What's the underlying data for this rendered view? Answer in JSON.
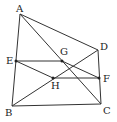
{
  "diagram": {
    "type": "geometry",
    "points": {
      "A": {
        "x": 20,
        "y": 14,
        "label_dx": -4,
        "label_dy": -2
      },
      "B": {
        "x": 12,
        "y": 106,
        "label_dx": -7,
        "label_dy": 10
      },
      "C": {
        "x": 101,
        "y": 104,
        "label_dx": 2,
        "label_dy": 10
      },
      "D": {
        "x": 98,
        "y": 50,
        "label_dx": 2,
        "label_dy": 0
      },
      "E": {
        "x": 16,
        "y": 61,
        "label_dx": -10,
        "label_dy": 3
      },
      "F": {
        "x": 99,
        "y": 78,
        "label_dx": 4,
        "label_dy": 4
      },
      "G": {
        "x": 62,
        "y": 61,
        "label_dx": -2,
        "label_dy": -6
      },
      "H": {
        "x": 53,
        "y": 78,
        "label_dx": -2,
        "label_dy": 11
      }
    },
    "labels": [
      "A",
      "B",
      "C",
      "D",
      "E",
      "F",
      "G",
      "H"
    ],
    "segments": [
      [
        "A",
        "B"
      ],
      [
        "A",
        "D"
      ],
      [
        "A",
        "C"
      ],
      [
        "B",
        "C"
      ],
      [
        "D",
        "C"
      ],
      [
        "B",
        "D"
      ],
      [
        "E",
        "G"
      ],
      [
        "G",
        "F"
      ],
      [
        "E",
        "H"
      ],
      [
        "H",
        "F"
      ]
    ],
    "dots": [
      "E",
      "F",
      "G",
      "H"
    ]
  }
}
